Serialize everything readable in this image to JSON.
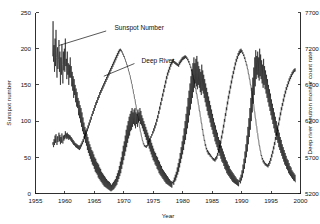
{
  "chart_data": {
    "type": "line",
    "title": "",
    "xlabel": "Year",
    "ylabel": "Sunspot number",
    "y2label": "Deep river neutron monitor count rate",
    "xlim": [
      1955,
      2000
    ],
    "ylim": [
      0,
      250
    ],
    "y2lim": [
      5200,
      7700
    ],
    "xticks": [
      1955,
      1960,
      1965,
      1970,
      1975,
      1980,
      1985,
      1990,
      1995,
      2000
    ],
    "xticklabels": [
      "1955",
      "1960",
      "1965",
      "1970",
      "1975",
      "1980",
      "1985",
      "1990",
      "1995",
      "2000"
    ],
    "yticks": [
      0,
      50,
      100,
      150,
      200,
      250
    ],
    "yticklabels": [
      "0",
      "50",
      "100",
      "150",
      "200",
      "250"
    ],
    "y2ticks": [
      5200,
      5700,
      6200,
      6700,
      7200,
      7700
    ],
    "y2ticklabels": [
      "5200",
      "5700",
      "6200",
      "6700",
      "7200",
      "7700"
    ],
    "grid": false,
    "legend": "none",
    "annotations": [
      {
        "text": "Sunspot Number",
        "text_x": 1968.4,
        "text_y_frac": 0.915,
        "leader_from_x": 1967.0,
        "leader_from_y_frac": 0.898,
        "leader_to_x": 1959.0,
        "leader_to_y_frac": 0.818
      },
      {
        "text": "Deep River",
        "text_x": 1973.0,
        "text_y_frac": 0.735,
        "leader_from_x": 1971.8,
        "leader_from_y_frac": 0.718,
        "leader_to_x": 1966.6,
        "leader_to_y_frac": 0.648
      }
    ],
    "series": [
      {
        "name": "Sunspot Number",
        "axis": "left",
        "x_start": 1957.9,
        "x_step": 0.0833333,
        "values": [
          190,
          238,
          182,
          205,
          168,
          214,
          176,
          226,
          188,
          160,
          202,
          172,
          185,
          212,
          168,
          196,
          150,
          188,
          164,
          206,
          178,
          152,
          196,
          170,
          200,
          168,
          214,
          176,
          186,
          158,
          196,
          164,
          180,
          150,
          178,
          160,
          188,
          160,
          176,
          148,
          168,
          142,
          162,
          132,
          158,
          136,
          150,
          126,
          145,
          120,
          140,
          118,
          132,
          108,
          128,
          104,
          122,
          98,
          118,
          92,
          112,
          86,
          105,
          82,
          98,
          76,
          92,
          70,
          88,
          66,
          82,
          60,
          78,
          56,
          72,
          52,
          68,
          48,
          64,
          44,
          60,
          40,
          58,
          38,
          54,
          34,
          50,
          30,
          48,
          28,
          44,
          26,
          42,
          22,
          40,
          20,
          36,
          18,
          34,
          16,
          30,
          14,
          28,
          12,
          26,
          10,
          24,
          9,
          22,
          8,
          20,
          7,
          18,
          6,
          17,
          5,
          16,
          4,
          14,
          3,
          12,
          4,
          14,
          5,
          16,
          6,
          18,
          8,
          20,
          10,
          24,
          12,
          28,
          16,
          32,
          20,
          38,
          24,
          44,
          28,
          50,
          34,
          58,
          40,
          66,
          46,
          72,
          52,
          80,
          58,
          88,
          64,
          94,
          70,
          100,
          76,
          106,
          80,
          110,
          86,
          114,
          88,
          118,
          92,
          112,
          96,
          116,
          94,
          118,
          90,
          112,
          96,
          110,
          92,
          116,
          98,
          112,
          100,
          118,
          96,
          114,
          94,
          108,
          90,
          104,
          86,
          100,
          82,
          96,
          78,
          92,
          74,
          88,
          70,
          84,
          66,
          80,
          62,
          76,
          58,
          74,
          54,
          70,
          50,
          66,
          46,
          62,
          44,
          58,
          40,
          56,
          38,
          52,
          34,
          50,
          32,
          46,
          28,
          44,
          26,
          40,
          24,
          38,
          22,
          34,
          20,
          32,
          18,
          30,
          16,
          28,
          14,
          26,
          13,
          24,
          12,
          22,
          11,
          20,
          10,
          18,
          9,
          17,
          8,
          16,
          14,
          18,
          12,
          22,
          16,
          26,
          18,
          30,
          22,
          36,
          26,
          42,
          30,
          48,
          36,
          56,
          42,
          64,
          48,
          72,
          54,
          80,
          60,
          90,
          68,
          100,
          74,
          110,
          82,
          120,
          90,
          132,
          98,
          142,
          108,
          152,
          116,
          162,
          124,
          172,
          132,
          180,
          140,
          188,
          146,
          180,
          152,
          186,
          148,
          190,
          144,
          182,
          150,
          176,
          146,
          172,
          140,
          168,
          136,
          178,
          142,
          170,
          138,
          164,
          132,
          158,
          126,
          152,
          120,
          146,
          114,
          140,
          108,
          134,
          104,
          128,
          98,
          122,
          92,
          116,
          88,
          110,
          82,
          104,
          78,
          98,
          72,
          94,
          68,
          88,
          64,
          84,
          60,
          78,
          56,
          74,
          52,
          70,
          48,
          66,
          44,
          62,
          42,
          58,
          38,
          54,
          34,
          50,
          32,
          46,
          28,
          44,
          26,
          40,
          24,
          38,
          22,
          34,
          20,
          32,
          18,
          30,
          16,
          28,
          15,
          26,
          14,
          24,
          13,
          22,
          12,
          20,
          11,
          19,
          10,
          18,
          16,
          22,
          14,
          26,
          18,
          32,
          22,
          40,
          28,
          48,
          34,
          58,
          42,
          68,
          50,
          80,
          58,
          92,
          68,
          104,
          78,
          118,
          88,
          132,
          100,
          146,
          112,
          160,
          124,
          174,
          136,
          188,
          148,
          198,
          158,
          190,
          164,
          196,
          160,
          188,
          156,
          200,
          162,
          192,
          158,
          184,
          152,
          178,
          146,
          186,
          150,
          176,
          144,
          170,
          138,
          164,
          132,
          158,
          126,
          150,
          120,
          144,
          114,
          138,
          108,
          130,
          102,
          124,
          96,
          118,
          90,
          112,
          84,
          106,
          80,
          100,
          74,
          94,
          70,
          88,
          64,
          84,
          60,
          78,
          56,
          74,
          52,
          68,
          48,
          64,
          44,
          60,
          40,
          56,
          38,
          52,
          34,
          48,
          32,
          46,
          28,
          42,
          26,
          38,
          24,
          36,
          22,
          32,
          20,
          30,
          18,
          28,
          17,
          26,
          16
        ]
      },
      {
        "name": "Deep River",
        "axis": "right",
        "x_start": 1957.9,
        "x_step": 0.0833333,
        "values": [
          5880,
          5910,
          5840,
          5950,
          5870,
          6000,
          5900,
          6020,
          5930,
          5870,
          5990,
          5910,
          5960,
          6040,
          5920,
          6010,
          5880,
          5980,
          5900,
          6030,
          5940,
          5890,
          6000,
          5930,
          6010,
          5950,
          6060,
          5970,
          6030,
          5950,
          6040,
          5960,
          6020,
          5940,
          6010,
          5950,
          6000,
          5930,
          5980,
          5910,
          5960,
          5890,
          5940,
          5870,
          5920,
          5860,
          5900,
          5840,
          5890,
          5830,
          5880,
          5820,
          5870,
          5810,
          5860,
          5800,
          5870,
          5820,
          5890,
          5850,
          5920,
          5880,
          5950,
          5910,
          5990,
          5950,
          6030,
          5990,
          6060,
          6020,
          6100,
          6060,
          6140,
          6100,
          6180,
          6140,
          6220,
          6180,
          6260,
          6220,
          6300,
          6270,
          6340,
          6300,
          6380,
          6340,
          6420,
          6380,
          6460,
          6420,
          6490,
          6450,
          6530,
          6490,
          6560,
          6520,
          6600,
          6560,
          6630,
          6590,
          6660,
          6620,
          6690,
          6650,
          6720,
          6680,
          6750,
          6710,
          6780,
          6740,
          6810,
          6770,
          6840,
          6800,
          6870,
          6830,
          6900,
          6860,
          6930,
          6890,
          6960,
          6920,
          6990,
          6950,
          7020,
          6980,
          7050,
          7010,
          7080,
          7040,
          7110,
          7070,
          7140,
          7100,
          7170,
          7130,
          7190,
          7160,
          7200,
          7170,
          7185,
          7150,
          7160,
          7120,
          7130,
          7090,
          7100,
          7060,
          7060,
          7020,
          7020,
          6980,
          6980,
          6940,
          6930,
          6890,
          6880,
          6840,
          6830,
          6780,
          6770,
          6720,
          6710,
          6650,
          6640,
          6580,
          6570,
          6510,
          6500,
          6440,
          6420,
          6360,
          6340,
          6280,
          6260,
          6200,
          6180,
          6120,
          6100,
          6050,
          6040,
          5990,
          5980,
          5930,
          5930,
          5880,
          5890,
          5850,
          5870,
          5840,
          5860,
          5830,
          5870,
          5850,
          5900,
          5880,
          5930,
          5910,
          5960,
          5940,
          5990,
          5970,
          6020,
          6000,
          6060,
          6030,
          6100,
          6060,
          6140,
          6100,
          6180,
          6140,
          6230,
          6190,
          6280,
          6240,
          6340,
          6300,
          6400,
          6360,
          6460,
          6420,
          6520,
          6480,
          6580,
          6540,
          6640,
          6600,
          6700,
          6660,
          6760,
          6720,
          6820,
          6780,
          6870,
          6830,
          6910,
          6870,
          6950,
          6910,
          6990,
          6950,
          7020,
          6980,
          7050,
          7000,
          7060,
          7010,
          7030,
          6990,
          7020,
          6980,
          7010,
          6970,
          7000,
          6960,
          6990,
          6950,
          7020,
          6980,
          7040,
          7000,
          7060,
          7020,
          7080,
          7040,
          7090,
          7050,
          7100,
          7060,
          7110,
          7070,
          7100,
          7060,
          7080,
          7040,
          7060,
          7010,
          7030,
          6980,
          6990,
          6940,
          6950,
          6890,
          6900,
          6840,
          6840,
          6780,
          6780,
          6720,
          6720,
          6650,
          6650,
          6580,
          6580,
          6510,
          6500,
          6430,
          6420,
          6340,
          6340,
          6260,
          6250,
          6170,
          6170,
          6080,
          6090,
          6000,
          6010,
          5930,
          5940,
          5860,
          5880,
          5810,
          5830,
          5770,
          5800,
          5740,
          5780,
          5730,
          5760,
          5710,
          5740,
          5700,
          5720,
          5680,
          5700,
          5660,
          5690,
          5650,
          5680,
          5640,
          5700,
          5660,
          5720,
          5680,
          5760,
          5720,
          5810,
          5770,
          5870,
          5830,
          5930,
          5890,
          6000,
          5960,
          6070,
          6030,
          6150,
          6110,
          6230,
          6190,
          6310,
          6270,
          6390,
          6350,
          6470,
          6430,
          6550,
          6510,
          6620,
          6580,
          6690,
          6650,
          6760,
          6720,
          6830,
          6790,
          6890,
          6850,
          6950,
          6910,
          7010,
          6970,
          7060,
          7020,
          7100,
          7060,
          7140,
          7100,
          7170,
          7120,
          7190,
          7140,
          7200,
          7150,
          7180,
          7130,
          7150,
          7100,
          7120,
          7060,
          7080,
          7020,
          7030,
          6970,
          6980,
          6920,
          6920,
          6850,
          6850,
          6780,
          6780,
          6700,
          6700,
          6620,
          6610,
          6530,
          6520,
          6440,
          6430,
          6340,
          6330,
          6240,
          6230,
          6140,
          6130,
          6040,
          6030,
          5950,
          5940,
          5860,
          5860,
          5790,
          5790,
          5720,
          5730,
          5670,
          5690,
          5630,
          5660,
          5610,
          5640,
          5590,
          5620,
          5580,
          5610,
          5570,
          5600,
          5560,
          5620,
          5580,
          5650,
          5610,
          5690,
          5650,
          5740,
          5700,
          5790,
          5750,
          5850,
          5810,
          5910,
          5870,
          5980,
          5940,
          6040,
          6000,
          6110,
          6070,
          6180,
          6140,
          6250,
          6210,
          6320,
          6280,
          6390,
          6350,
          6450,
          6410,
          6510,
          6470,
          6570,
          6530,
          6620,
          6580,
          6670,
          6630,
          6710,
          6670,
          6750,
          6710,
          6790,
          6750,
          6820,
          6780,
          6850,
          6810,
          6880,
          6840,
          6900,
          6860,
          6920,
          6880,
          6930,
          6890
        ]
      }
    ]
  },
  "axes": {
    "left_title": "Sunspot number",
    "right_title": "Deep river neutron monitor count rate",
    "bottom_title": "Year"
  },
  "annotations": {
    "sunspot_label": "Sunspot Number",
    "deep_river_label": "Deep River"
  },
  "colors": {
    "line": "#000000",
    "axis": "#1a1a1a",
    "background": "#ffffff"
  }
}
